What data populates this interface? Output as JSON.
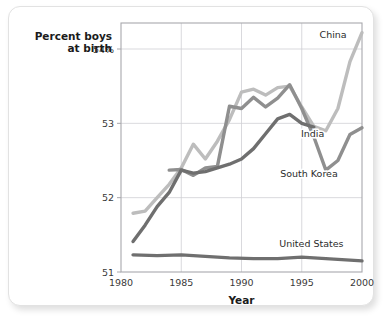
{
  "card": {
    "background": "#ffffff",
    "border_color": "#e2e2e2"
  },
  "chart_data": {
    "type": "line",
    "title": "",
    "ylabel_line1": "Percent boys",
    "ylabel_line2": "at birth",
    "xlabel": "Year",
    "xlim": [
      1980,
      2000
    ],
    "ylim": [
      51,
      54.35
    ],
    "grid": true,
    "legend_position": "inline-right",
    "xticks": [
      1980,
      1985,
      1990,
      1995,
      2000
    ],
    "xticklabels": [
      "1980",
      "1985",
      "1990",
      "1995",
      "2000"
    ],
    "yticks": [
      51,
      52,
      53,
      54
    ],
    "yticklabels": [
      "51",
      "52",
      "53",
      "54%"
    ],
    "series": [
      {
        "name": "China",
        "color": "#bdbdbd",
        "linewidth": 3.4,
        "label_x": 1997.6,
        "label_y": 54.15,
        "x": [
          1981,
          1982,
          1983,
          1984,
          1985,
          1986,
          1987,
          1988,
          1989,
          1990,
          1991,
          1992,
          1993,
          1994,
          1995,
          1996,
          1997,
          1998,
          1999,
          2000
        ],
        "y": [
          51.79,
          51.82,
          52.0,
          52.18,
          52.4,
          52.72,
          52.52,
          52.76,
          53.05,
          53.42,
          53.46,
          53.38,
          53.48,
          53.5,
          53.22,
          52.96,
          52.9,
          53.2,
          53.83,
          54.22
        ]
      },
      {
        "name": "South Korea",
        "color": "#8f8f8f",
        "linewidth": 3.4,
        "label_x": 1995.6,
        "label_y": 52.28,
        "x": [
          1984,
          1985,
          1986,
          1987,
          1988,
          1989,
          1990,
          1991,
          1992,
          1993,
          1994,
          1995,
          1996,
          1997,
          1998,
          1999,
          2000
        ],
        "y": [
          52.37,
          52.38,
          52.3,
          52.4,
          52.42,
          53.23,
          53.2,
          53.35,
          53.22,
          53.34,
          53.52,
          53.2,
          52.82,
          52.37,
          52.5,
          52.85,
          52.94
        ]
      },
      {
        "name": "India",
        "color": "#6f6f6f",
        "linewidth": 3.4,
        "label_x": 1995.9,
        "label_y": 52.82,
        "x": [
          1981,
          1982,
          1983,
          1984,
          1985,
          1986,
          1987,
          1988,
          1989,
          1990,
          1991,
          1992,
          1993,
          1994,
          1995,
          1996
        ],
        "y": [
          51.41,
          51.63,
          51.88,
          52.07,
          52.37,
          52.33,
          52.35,
          52.4,
          52.45,
          52.52,
          52.66,
          52.86,
          53.06,
          53.12,
          53.0,
          52.95
        ]
      },
      {
        "name": "United States",
        "color": "#6f6f6f",
        "linewidth": 3.4,
        "label_x": 1995.8,
        "label_y": 51.34,
        "x": [
          1981,
          1983,
          1985,
          1987,
          1989,
          1991,
          1993,
          1995,
          1997,
          1999,
          2000
        ],
        "y": [
          51.23,
          51.22,
          51.23,
          51.21,
          51.19,
          51.18,
          51.18,
          51.2,
          51.18,
          51.16,
          51.15
        ]
      }
    ]
  }
}
